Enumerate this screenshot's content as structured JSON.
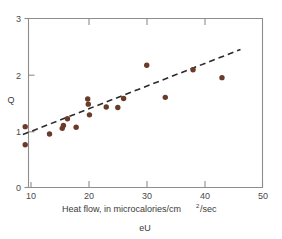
{
  "chart_data": {
    "type": "scatter",
    "title": "",
    "xlabel": "Heat flow, in microcalories/cm²/sec",
    "xlabel_parts": {
      "before": "Heat flow, in microcalories/cm",
      "superscript": "2",
      "after": "/sec"
    },
    "ylabel": "Q",
    "caption": "eU",
    "xlim": [
      5,
      50
    ],
    "ylim": [
      0,
      3
    ],
    "xticks": [
      10,
      20,
      30,
      40,
      50
    ],
    "yticks": [
      0,
      1,
      2,
      3
    ],
    "xtick_labels": [
      "10",
      "20",
      "30",
      "40",
      "50"
    ],
    "ytick_labels": [
      "0",
      "1",
      "2",
      "3"
    ],
    "grid": false,
    "legend": "none",
    "point_color": "#6b3b2a",
    "line_color": "#2b2b2b",
    "axis_color": "#8d8d8d",
    "points": [
      {
        "x": 9.0,
        "y": 1.08
      },
      {
        "x": 9.0,
        "y": 0.76
      },
      {
        "x": 13.2,
        "y": 0.95
      },
      {
        "x": 15.4,
        "y": 1.05
      },
      {
        "x": 15.6,
        "y": 1.1
      },
      {
        "x": 16.3,
        "y": 1.22
      },
      {
        "x": 17.8,
        "y": 1.07
      },
      {
        "x": 19.8,
        "y": 1.57
      },
      {
        "x": 19.9,
        "y": 1.48
      },
      {
        "x": 20.1,
        "y": 1.29
      },
      {
        "x": 23.0,
        "y": 1.43
      },
      {
        "x": 25.0,
        "y": 1.42
      },
      {
        "x": 26.0,
        "y": 1.58
      },
      {
        "x": 30.0,
        "y": 2.17
      },
      {
        "x": 33.2,
        "y": 1.6
      },
      {
        "x": 38.0,
        "y": 2.09
      },
      {
        "x": 43.0,
        "y": 1.95
      }
    ],
    "trend_line": {
      "style": "dashed",
      "x0": 8.6,
      "y0": 0.94,
      "x1": 46.2,
      "y1": 2.45
    }
  }
}
